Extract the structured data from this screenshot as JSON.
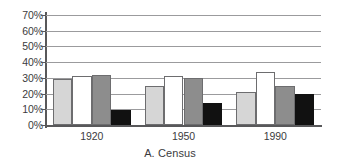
{
  "chart_data": {
    "type": "bar",
    "title": "A. Census",
    "xlabel": "",
    "ylabel": "",
    "categories": [
      "1920",
      "1950",
      "1990"
    ],
    "series": [
      {
        "name": "series-1",
        "fill": "#d6d6d6",
        "values": [
          29,
          25,
          21
        ]
      },
      {
        "name": "series-2",
        "fill": "#ffffff",
        "values": [
          31,
          31,
          34
        ]
      },
      {
        "name": "series-3",
        "fill": "#8d8d8d",
        "values": [
          32,
          30,
          25
        ]
      },
      {
        "name": "series-4",
        "fill": "#111111",
        "values": [
          9.5,
          14,
          20
        ]
      }
    ],
    "ylim": [
      0,
      70
    ],
    "ytick_values": [
      0,
      10,
      20,
      30,
      40,
      50,
      60,
      70
    ],
    "ytick_labels": [
      "0%",
      "10%",
      "20%",
      "30%",
      "40%",
      "50%",
      "60%",
      "70%"
    ],
    "grid": true,
    "legend": false,
    "axis_color": "#58585a",
    "grid_color": "#9b9b9d",
    "text_color": "#3b3b3d",
    "background": "#ffffff"
  },
  "caption": {
    "text": "A. Census"
  }
}
